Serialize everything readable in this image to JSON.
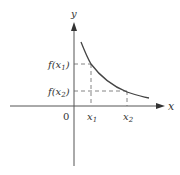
{
  "diagram": {
    "type": "function-graph",
    "axes": {
      "x_label": "x",
      "y_label": "y",
      "origin_label": "0"
    },
    "points": [
      {
        "x_label": "x",
        "x_sub": "1",
        "y_label_prefix": "f(x",
        "y_sub": "1",
        "y_label_suffix": ")"
      },
      {
        "x_label": "x",
        "x_sub": "2",
        "y_label_prefix": "f(x",
        "y_sub": "2",
        "y_label_suffix": ")"
      }
    ],
    "colors": {
      "axis": "#555555",
      "curve": "#444444",
      "dash": "#666666",
      "text": "#333333"
    }
  }
}
